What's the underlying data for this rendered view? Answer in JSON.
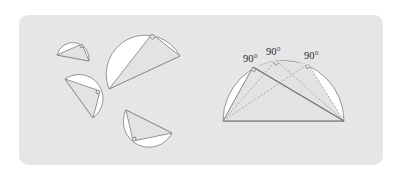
{
  "colors": {
    "background": "#ffffff",
    "panel": "#e6e6e6",
    "semicircle_fill": "#ffffff",
    "triangle_fill": "#e3e3e3",
    "stroke": "#8a8a8a",
    "label": "#2a2a2a"
  },
  "left_group": {
    "description": "Scattered semicircles, each containing an inscribed right triangle with a right-angle marker",
    "pieces": [
      {
        "name": "small-top-left",
        "right_angle_marked": true
      },
      {
        "name": "large-top-center",
        "right_angle_marked": true
      },
      {
        "name": "middle-left",
        "right_angle_marked": true
      },
      {
        "name": "bottom-right",
        "right_angle_marked": true
      }
    ]
  },
  "right_group": {
    "description": "Semicircle with three right triangles sharing the diameter as hypotenuse",
    "angle_labels": [
      {
        "text": "90°",
        "x": 243,
        "y": 62
      },
      {
        "text": "90°",
        "x": 266,
        "y": 55
      },
      {
        "text": "90°",
        "x": 304,
        "y": 59
      }
    ]
  }
}
